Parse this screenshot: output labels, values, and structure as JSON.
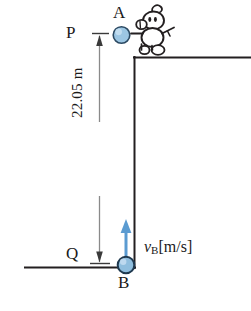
{
  "figure": {
    "labels": {
      "point_a": "A",
      "point_b": "B",
      "point_p": "P",
      "point_q": "Q",
      "height": "22.05 m",
      "velocity_symbol": "v",
      "velocity_subscript": "B",
      "velocity_units": "[m/s]"
    },
    "measurements": {
      "height_value": "22.05",
      "height_unit": "m"
    },
    "colors": {
      "ball_fill": "#8fbede",
      "ball_fill_light": "#b9d8ee",
      "ball_stroke": "#24405a",
      "arrow_blue": "#5b9bd1",
      "line_dark": "#231f20",
      "dimension_gray": "#8a8a8a",
      "text": "#1a1a1a"
    },
    "elements": {
      "wall_top_edge": "horizontal ledge surface",
      "wall_vertical_edge": "vertical cliff face",
      "ground_line": "ground surface",
      "dimension_line": "vertical double-headed dimension arrow",
      "velocity_arrow": "upward blue velocity vector at B",
      "character": "cartoon person standing on ledge"
    }
  }
}
